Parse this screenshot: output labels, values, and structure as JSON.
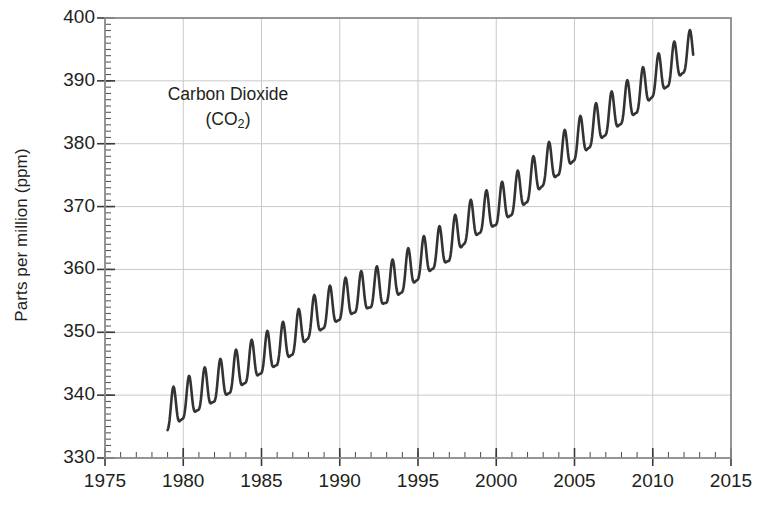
{
  "chart_data": {
    "type": "line",
    "title": "",
    "annotation_line1": "Carbon Dioxide",
    "annotation_line2_prefix": "(CO",
    "annotation_line2_sub": "2",
    "annotation_line2_suffix": ")",
    "xlabel": "",
    "ylabel": "Parts per million (ppm)",
    "xlim": [
      1975,
      2015
    ],
    "ylim": [
      330,
      400
    ],
    "x_major_ticks": [
      1975,
      1980,
      1985,
      1990,
      1995,
      2000,
      2005,
      2010,
      2015
    ],
    "x_tick_labels": [
      "1975",
      "1980",
      "1985",
      "1990",
      "1995",
      "2000",
      "2005",
      "2010",
      "2015"
    ],
    "x_minor_step": 1,
    "y_major_ticks": [
      330,
      340,
      350,
      360,
      370,
      380,
      390,
      400
    ],
    "y_tick_labels": [
      "330",
      "340",
      "350",
      "360",
      "370",
      "380",
      "390",
      "400"
    ],
    "y_minor_step": 1,
    "grid": "both-major",
    "grid_color": "#c9c9c9",
    "axis_color": "#8a8a8a",
    "line_color": "#333333",
    "line_width": 2.6,
    "legend": "none",
    "series": [
      {
        "name": "Mauna Loa atmospheric CO2 monthly mean",
        "description": "Monthly mean CO2 concentration showing rising trend with annual seasonal sawtooth of about 6 ppm peak-to-peak",
        "x_start": 1979.0,
        "x_end": 2012.6,
        "seasonal_amplitude_ppm": 3.1,
        "seasonal_peak_month_fraction": 0.37,
        "trend_anchor_points": [
          {
            "x": 1979.0,
            "y": 336.8
          },
          {
            "x": 1980.0,
            "y": 338.7
          },
          {
            "x": 1981.0,
            "y": 340.1
          },
          {
            "x": 1982.0,
            "y": 341.4
          },
          {
            "x": 1983.0,
            "y": 342.8
          },
          {
            "x": 1984.0,
            "y": 344.4
          },
          {
            "x": 1985.0,
            "y": 345.9
          },
          {
            "x": 1986.0,
            "y": 347.2
          },
          {
            "x": 1987.0,
            "y": 348.9
          },
          {
            "x": 1988.0,
            "y": 351.5
          },
          {
            "x": 1989.0,
            "y": 353.1
          },
          {
            "x": 1990.0,
            "y": 354.4
          },
          {
            "x": 1991.0,
            "y": 355.6
          },
          {
            "x": 1992.0,
            "y": 356.4
          },
          {
            "x": 1993.0,
            "y": 357.1
          },
          {
            "x": 1994.0,
            "y": 358.8
          },
          {
            "x": 1995.0,
            "y": 360.8
          },
          {
            "x": 1996.0,
            "y": 362.6
          },
          {
            "x": 1997.0,
            "y": 363.8
          },
          {
            "x": 1998.0,
            "y": 366.6
          },
          {
            "x": 1999.0,
            "y": 368.3
          },
          {
            "x": 2000.0,
            "y": 369.5
          },
          {
            "x": 2001.0,
            "y": 371.1
          },
          {
            "x": 2002.0,
            "y": 373.2
          },
          {
            "x": 2003.0,
            "y": 375.8
          },
          {
            "x": 2004.0,
            "y": 377.5
          },
          {
            "x": 2005.0,
            "y": 379.8
          },
          {
            "x": 2006.0,
            "y": 381.9
          },
          {
            "x": 2007.0,
            "y": 383.8
          },
          {
            "x": 2008.0,
            "y": 385.6
          },
          {
            "x": 2009.0,
            "y": 387.4
          },
          {
            "x": 2010.0,
            "y": 389.9
          },
          {
            "x": 2011.0,
            "y": 391.6
          },
          {
            "x": 2012.0,
            "y": 393.8
          },
          {
            "x": 2012.6,
            "y": 394.5
          }
        ]
      }
    ]
  }
}
